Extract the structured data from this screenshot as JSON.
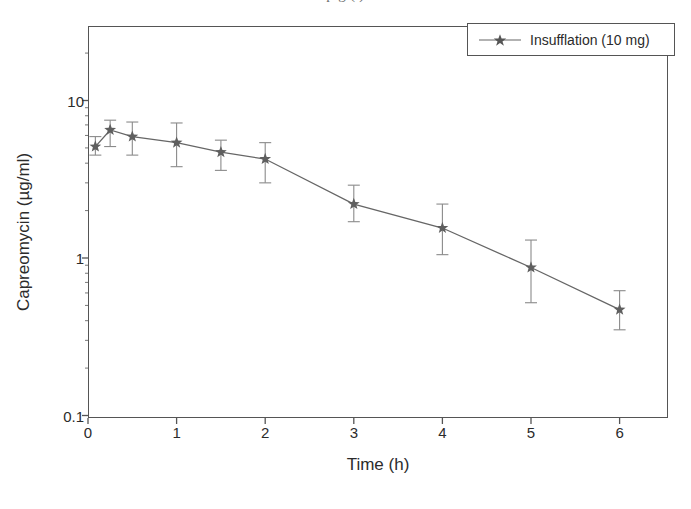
{
  "caption_cut": "p                                                 g (        )",
  "chart_data": {
    "type": "line",
    "title": "",
    "xlabel": "Time (h)",
    "ylabel": "Capreomycin (µg/ml)",
    "yscale": "log",
    "ylim": [
      0.1,
      30
    ],
    "xlim": [
      -0.1,
      6.6
    ],
    "grid": false,
    "legend_position": "top-right",
    "ytick_labels": [
      "10",
      "1",
      "0.1"
    ],
    "ytick_values": [
      10,
      1,
      0.1
    ],
    "xtick_labels": [
      "0",
      "1",
      "2",
      "3",
      "4",
      "5",
      "6"
    ],
    "xtick_values": [
      0,
      1,
      2,
      3,
      4,
      5,
      6
    ],
    "series": [
      {
        "name": "Insufflation (10 mg)",
        "marker": "star",
        "color": "#666666",
        "x": [
          0.083,
          0.25,
          0.5,
          1,
          1.5,
          2,
          3,
          4,
          5,
          6
        ],
        "values": [
          5.1,
          6.5,
          5.9,
          5.4,
          4.7,
          4.25,
          2.2,
          1.55,
          0.87,
          0.47
        ],
        "err_low": [
          4.5,
          5.1,
          4.5,
          3.8,
          3.6,
          3.0,
          1.7,
          1.05,
          0.52,
          0.35
        ],
        "err_high": [
          5.9,
          7.5,
          7.3,
          7.2,
          5.6,
          5.4,
          2.9,
          2.2,
          1.3,
          0.62
        ]
      }
    ]
  },
  "legend": {
    "entries": [
      {
        "label": "Insufflation (10 mg)"
      }
    ]
  }
}
